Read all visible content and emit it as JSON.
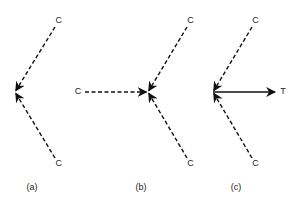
{
  "diagram": {
    "stroke_color": "#111111",
    "panels": [
      {
        "id": "a",
        "caption": "(a)",
        "center": [
          15,
          92
        ],
        "arrows": [
          {
            "from_label": "C",
            "from": [
              55,
              27
            ],
            "style": "dashed"
          },
          {
            "from_label": "C",
            "from": [
              55,
              158
            ],
            "style": "dashed"
          }
        ]
      },
      {
        "id": "b",
        "caption": "(b)",
        "center": [
          148,
          92
        ],
        "arrows": [
          {
            "from_label": "C",
            "from": [
              187,
              27
            ],
            "style": "dashed"
          },
          {
            "from_label": "C",
            "from": [
              85,
              92
            ],
            "style": "dashed"
          },
          {
            "from_label": "C",
            "from": [
              187,
              158
            ],
            "style": "dashed"
          }
        ]
      },
      {
        "id": "c",
        "caption": "(c)",
        "center": [
          213,
          92
        ],
        "arrows": [
          {
            "from_label": "C",
            "from": [
              252,
              27
            ],
            "style": "dashed"
          },
          {
            "from_label": "C",
            "from": [
              252,
              158
            ],
            "style": "dashed"
          }
        ],
        "outgoing": {
          "to_label": "T",
          "to": [
            275,
            92
          ],
          "style": "solid"
        }
      }
    ]
  }
}
